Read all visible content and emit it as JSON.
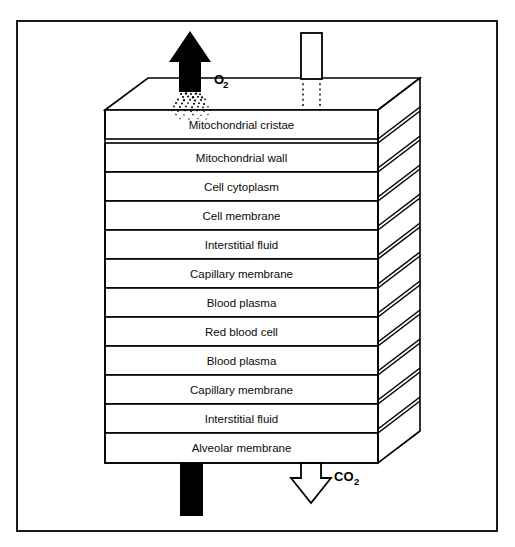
{
  "figure": {
    "border_color": "#1a1a1a",
    "line_color": "#000000",
    "fill_color": "#ffffff"
  },
  "layers": [
    {
      "index": 1,
      "label": "Mitochondrial cristae"
    },
    {
      "index": 2,
      "label": "Mitochondrial wall"
    },
    {
      "index": 3,
      "label": "Cell cytoplasm"
    },
    {
      "index": 4,
      "label": "Cell membrane"
    },
    {
      "index": 5,
      "label": "Interstitial fluid"
    },
    {
      "index": 6,
      "label": "Capillary membrane"
    },
    {
      "index": 7,
      "label": "Blood plasma"
    },
    {
      "index": 8,
      "label": "Red blood cell"
    },
    {
      "index": 9,
      "label": "Blood plasma"
    },
    {
      "index": 10,
      "label": "Capillary membrane"
    },
    {
      "index": 11,
      "label": "Interstitial fluid"
    },
    {
      "index": 12,
      "label": "Alveolar membrane"
    }
  ],
  "annotations": {
    "oxygen": {
      "label": "O",
      "subscript": "2",
      "direction": "up",
      "style": "solid-black-arrow"
    },
    "carbon_dioxide": {
      "label": "CO",
      "subscript": "2",
      "direction": "down",
      "style": "white-outline-arrow"
    }
  }
}
